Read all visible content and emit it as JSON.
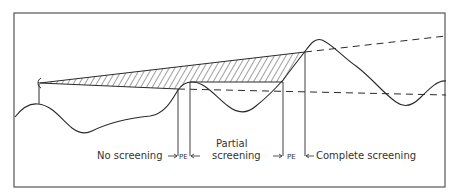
{
  "diagram": {
    "type": "terrain screening profile",
    "labels": {
      "no_screening": "No screening",
      "partial_line1": "Partial",
      "partial_line2": "screening",
      "complete_screening": "Complete screening",
      "pe1": "PE",
      "pe2": "PE"
    },
    "colors": {
      "line": "#2a2a2a",
      "frame": "#555555",
      "background": "#ffffff"
    }
  }
}
